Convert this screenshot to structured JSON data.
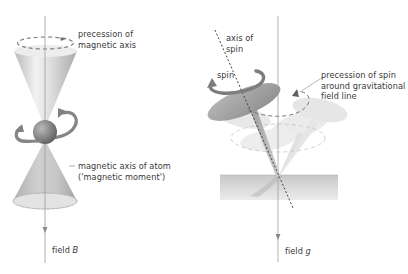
{
  "figure": {
    "left_panel": {
      "name": "magnetic-precession",
      "labels": {
        "precession_line1": "precession of",
        "precession_line2": "magnetic axis",
        "axis_line1": "magnetic axis of atom",
        "axis_line2": "('magnetic moment')",
        "field_prefix": "field ",
        "field_symbol": "B"
      }
    },
    "right_panel": {
      "name": "gyroscope-precession",
      "labels": {
        "spin_axis_line1": "axis of",
        "spin_axis_line2": "spin",
        "spin": "spin",
        "precession_line1": "precession of spin",
        "precession_line2": "around gravitational",
        "precession_line3": "field line",
        "field_prefix": "field ",
        "field_symbol": "g"
      }
    },
    "colors": {
      "axis_line": "#9a9a9a",
      "cone_light": "#e6e6e6",
      "cone_dark": "#b5b5b5",
      "sphere": "#8a8a8a",
      "arrow": "#7d7d7d",
      "disc_top": "#a8a8a8",
      "ghost_disc": "#e8e8e8",
      "plane": "#d3d3d3",
      "text": "#3a3a3a"
    }
  }
}
